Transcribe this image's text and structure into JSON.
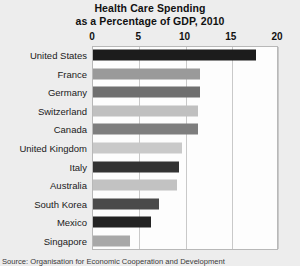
{
  "chart_data": {
    "type": "bar",
    "orientation": "horizontal",
    "title": "Health Care Spending as a Percentage of GDP, 2010",
    "title_lines": [
      "Health Care Spending",
      "as a Percentage of GDP, 2010"
    ],
    "xlabel": "",
    "ylabel": "",
    "xlim": [
      0,
      20
    ],
    "xticks": [
      0,
      5,
      10,
      15,
      20
    ],
    "xtick_labels": [
      "0",
      "5",
      "10",
      "15",
      "20"
    ],
    "grid": true,
    "legend": "none",
    "categories": [
      "United States",
      "France",
      "Germany",
      "Switzerland",
      "Canada",
      "United Kingdom",
      "Italy",
      "Australia",
      "South Korea",
      "Mexico",
      "Singapore"
    ],
    "values": [
      17.6,
      11.6,
      11.6,
      11.4,
      11.4,
      9.6,
      9.3,
      9.1,
      7.1,
      6.3,
      4.0
    ],
    "bar_colors": [
      "#1c1c1c",
      "#9a9a9a",
      "#6f6f6f",
      "#c0c0c0",
      "#7e7e7e",
      "#c9c9c9",
      "#333333",
      "#c2c2c2",
      "#4a4a4a",
      "#232323",
      "#a8a8a8"
    ],
    "source": "Source: Organisation for Economic Cooperation and Development"
  },
  "colors": {
    "background": "#ededed",
    "plot_background": "#fdfdfd",
    "gridline": "#c9c9c9",
    "frame": "#b8b8b8",
    "text": "#1a1a1a"
  }
}
